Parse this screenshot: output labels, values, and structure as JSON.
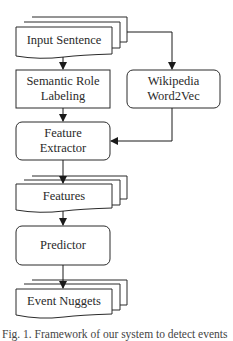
{
  "diagram": {
    "type": "flowchart",
    "nodes": {
      "input_sentence": {
        "label": "Input Sentence",
        "shape": "multi-document"
      },
      "srl": {
        "label_line1": "Semantic Role",
        "label_line2": "Labeling",
        "shape": "rectangle"
      },
      "word2vec": {
        "label_line1": "Wikipedia",
        "label_line2": "Word2Vec",
        "shape": "rounded-rectangle"
      },
      "feature_extractor": {
        "label_line1": "Feature",
        "label_line2": "Extractor",
        "shape": "rounded-rectangle"
      },
      "features": {
        "label": "Features",
        "shape": "multi-document"
      },
      "predictor": {
        "label": "Predictor",
        "shape": "rounded-rectangle"
      },
      "event_nuggets": {
        "label": "Event Nuggets",
        "shape": "multi-document"
      }
    },
    "edges": [
      {
        "from": "Input Sentence",
        "to": "Semantic Role Labeling"
      },
      {
        "from": "Input Sentence",
        "to": "Wikipedia Word2Vec"
      },
      {
        "from": "Semantic Role Labeling",
        "to": "Feature Extractor"
      },
      {
        "from": "Wikipedia Word2Vec",
        "to": "Feature Extractor"
      },
      {
        "from": "Feature Extractor",
        "to": "Features"
      },
      {
        "from": "Features",
        "to": "Predictor"
      },
      {
        "from": "Predictor",
        "to": "Event Nuggets"
      }
    ],
    "colors": {
      "stroke": "#2b2b2b",
      "fill": "#ffffff",
      "text": "#2a2a2a"
    }
  },
  "caption": {
    "text": "Fig. 1. Framework of our system to detect events"
  }
}
